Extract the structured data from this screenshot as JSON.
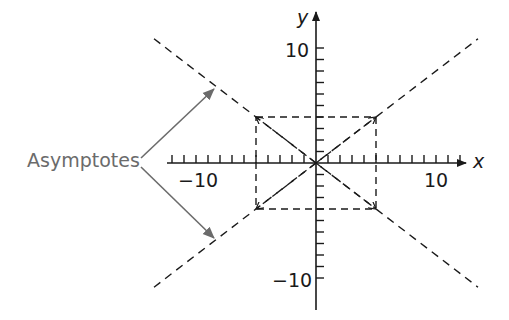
{
  "diagram": {
    "type": "hyperbola-asymptotes",
    "axes": {
      "x_label": "x",
      "y_label": "y",
      "x_ticks": {
        "min": -12,
        "max": 12,
        "step": 1
      },
      "y_ticks": {
        "min": -10,
        "max": 10,
        "step": 1
      },
      "x_tick_labels": [
        {
          "value": -10,
          "text": "−10"
        },
        {
          "value": 10,
          "text": "10"
        }
      ],
      "y_tick_labels": [
        {
          "value": 10,
          "text": "10"
        },
        {
          "value": -10,
          "text": "−10"
        }
      ]
    },
    "central_rectangle": {
      "a": 5,
      "b": 4,
      "style": "dashed"
    },
    "asymptotes": [
      {
        "equation": "y = (4/5)x",
        "style": "dashed"
      },
      {
        "equation": "y = -(4/5)x",
        "style": "dashed"
      }
    ],
    "callout": {
      "text": "Asymptotes",
      "arrows_to": [
        "upper-left asymptote",
        "lower-left asymptote"
      ]
    },
    "colors": {
      "line": "#1a1a1a",
      "callout": "#6b6b6b"
    }
  }
}
